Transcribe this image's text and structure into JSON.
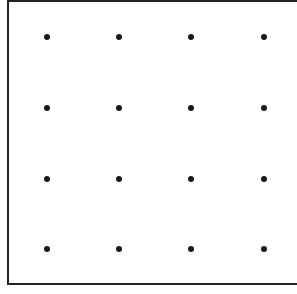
{
  "grid": {
    "rows": 4,
    "cols": 4,
    "dot_color": "#1a1a1a",
    "border_color": "#222222",
    "xs": [
      47,
      119,
      191,
      264
    ],
    "ys": [
      37,
      108,
      179,
      249
    ]
  }
}
